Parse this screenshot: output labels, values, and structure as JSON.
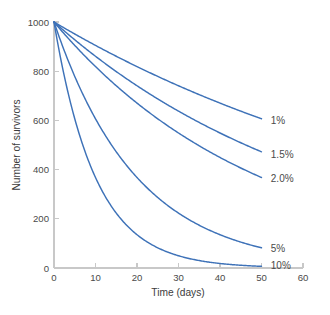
{
  "chart_data": {
    "type": "line",
    "title": "",
    "xlabel": "Time (days)",
    "ylabel": "Number of survivors",
    "xlim": [
      0,
      60
    ],
    "ylim": [
      0,
      1000
    ],
    "xticks": [
      0,
      10,
      20,
      30,
      40,
      50,
      60
    ],
    "yticks": [
      0,
      200,
      400,
      600,
      800,
      1000
    ],
    "xticklabels": [
      "0",
      "10",
      "20",
      "30",
      "40",
      "50",
      "60"
    ],
    "yticklabels": [
      "0",
      "200",
      "400",
      "600",
      "800",
      "1000"
    ],
    "grid": false,
    "legend_position": "inline-right-annotations",
    "x": [
      0,
      5,
      10,
      15,
      20,
      25,
      30,
      35,
      40,
      45,
      50
    ],
    "series": [
      {
        "name": "1%",
        "label": "1%",
        "rate_per_day": 0.01,
        "color": "#3e72b8",
        "values": [
          1000,
          951,
          905,
          861,
          819,
          779,
          741,
          705,
          670,
          638,
          607
        ]
      },
      {
        "name": "1.5%",
        "label": "1.5%",
        "rate_per_day": 0.015,
        "color": "#3e72b8",
        "values": [
          1000,
          928,
          861,
          799,
          741,
          687,
          638,
          592,
          549,
          509,
          472
        ]
      },
      {
        "name": "2.0%",
        "label": "2.0%",
        "rate_per_day": 0.02,
        "color": "#3e72b8",
        "values": [
          1000,
          905,
          819,
          741,
          670,
          607,
          549,
          497,
          449,
          407,
          368
        ]
      },
      {
        "name": "5%",
        "label": "5%",
        "rate_per_day": 0.05,
        "color": "#3e72b8",
        "values": [
          1000,
          779,
          607,
          472,
          368,
          287,
          223,
          174,
          135,
          105,
          82
        ]
      },
      {
        "name": "10%",
        "label": "10%",
        "rate_per_day": 0.1,
        "color": "#3e72b8",
        "values": [
          1000,
          607,
          368,
          223,
          135,
          82,
          50,
          30,
          18,
          11,
          7
        ]
      }
    ],
    "annotations": [
      {
        "text": "1%",
        "x_days": 52,
        "y_value": 600
      },
      {
        "text": "1.5%",
        "x_days": 52,
        "y_value": 462
      },
      {
        "text": "2.0%",
        "x_days": 52,
        "y_value": 362
      },
      {
        "text": "5%",
        "x_days": 52,
        "y_value": 78
      },
      {
        "text": "10%",
        "x_days": 52,
        "y_value": 10
      }
    ],
    "colors": {
      "curve": "#3e72b8",
      "axis": "#c8c8c8",
      "text": "#4a4a4a",
      "background": "#ffffff"
    }
  },
  "figure": {
    "caption_ghost": ""
  }
}
